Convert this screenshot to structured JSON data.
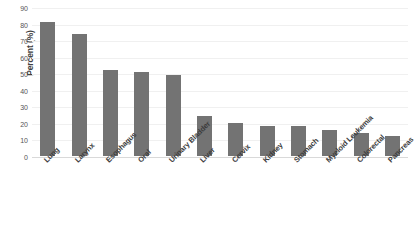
{
  "chart_data": {
    "type": "bar",
    "title": "",
    "subtitle": "",
    "xlabel": "",
    "ylabel": "Percent (%)",
    "ylim": [
      0,
      90
    ],
    "ytick_step": 10,
    "yticks": [
      0,
      10,
      20,
      30,
      40,
      50,
      60,
      70,
      80,
      90
    ],
    "grid": true,
    "legend": false,
    "legend_position": "none",
    "orientation": "vertical",
    "categories": [
      "Lung",
      "Larynx",
      "Esophagus",
      "Oral",
      "Urinary Bladder",
      "Liver",
      "Cervix",
      "Kidney",
      "Stomach",
      "Myeloid Leukemia",
      "Colorectal",
      "Pancreas"
    ],
    "values": [
      81,
      74,
      52,
      51,
      49,
      24,
      20,
      18,
      18,
      16,
      14,
      12
    ],
    "bar_color": "#737373",
    "gridline_color": "#f0f0f0",
    "axis_color": "#d9d9d9",
    "background_color": "#ffffff"
  }
}
